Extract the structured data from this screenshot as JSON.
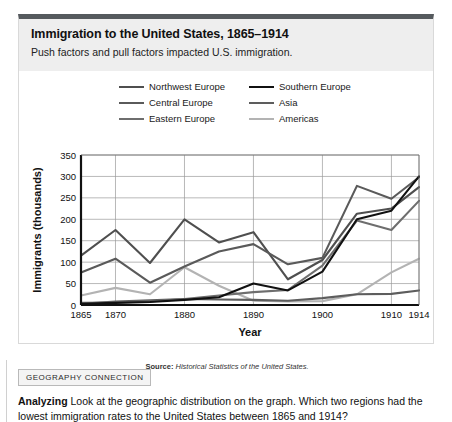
{
  "header": {
    "title": "Immigration to the United States, 1865–1914",
    "subtitle": "Push factors and pull factors impacted U.S. immigration."
  },
  "source": {
    "label": "Source:",
    "text": "Historical Statistics of the United States."
  },
  "bottom": {
    "tag": "GEOGRAPHY CONNECTION",
    "prompt_label": "Analyzing",
    "prompt_text": "Look at the geographic distribution on the graph. Which two regions had the lowest immigration rates to the United States between 1865 and 1914?"
  },
  "chart_data": {
    "type": "line",
    "title": "Immigration to the United States, 1865–1914",
    "xlabel": "Year",
    "ylabel": "Immigrants (thousands)",
    "xlim": [
      1865,
      1914
    ],
    "ylim": [
      0,
      350
    ],
    "ytick_step": 50,
    "yticks": [
      0,
      50,
      100,
      150,
      200,
      250,
      300,
      350
    ],
    "xticks": [
      1865,
      1870,
      1880,
      1890,
      1900,
      1910,
      1914
    ],
    "xtick_labels": [
      "1865",
      "1870",
      "1880",
      "1890",
      "1900",
      "1910",
      "1914"
    ],
    "gridlines": "both",
    "legend_position": "above-plot",
    "x": [
      1865,
      1870,
      1875,
      1880,
      1885,
      1890,
      1895,
      1900,
      1905,
      1910,
      1914
    ],
    "series": [
      {
        "name": "Northwest Europe",
        "color": "#4f4f4f",
        "values": [
          115,
          175,
          98,
          200,
          146,
          170,
          60,
          105,
          213,
          225,
          275
        ]
      },
      {
        "name": "Central Europe",
        "color": "#5a5a5a",
        "values": [
          76,
          108,
          52,
          90,
          125,
          142,
          95,
          110,
          278,
          248,
          298
        ]
      },
      {
        "name": "Eastern Europe",
        "color": "#6e6e6e",
        "values": [
          5,
          6,
          8,
          14,
          22,
          30,
          35,
          92,
          197,
          175,
          243
        ]
      },
      {
        "name": "Southern Europe",
        "color": "#111111",
        "values": [
          3,
          5,
          7,
          12,
          18,
          50,
          34,
          78,
          200,
          220,
          300
        ]
      },
      {
        "name": "Asia",
        "color": "#5d5d5d",
        "values": [
          3,
          8,
          11,
          14,
          13,
          12,
          10,
          16,
          25,
          26,
          34
        ]
      },
      {
        "name": "Americas",
        "color": "#b3b3b3",
        "values": [
          22,
          40,
          25,
          88,
          45,
          10,
          8,
          9,
          25,
          76,
          108
        ]
      }
    ]
  }
}
